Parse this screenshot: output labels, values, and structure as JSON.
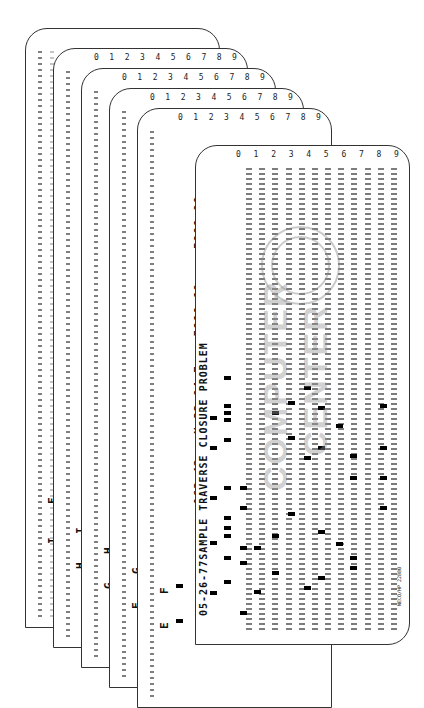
{
  "image": {
    "subject": "stack of punched computer cards",
    "card_count": 7
  },
  "cards": [
    {
      "id": 1,
      "label_left": "I",
      "label_right": "E",
      "distance": "425.44",
      "bearing": "N 16 04 W"
    },
    {
      "id": 2,
      "label_left": "H",
      "label_right": "I",
      "distance": "327.51",
      "bearing": "S 51 59 W"
    },
    {
      "id": 3,
      "label_left": "G",
      "label_right": "H",
      "distance": "319.19",
      "bearing": "S 10 30 E"
    },
    {
      "id": 4,
      "label_left": "F",
      "label_right": "G",
      "distance": "233.71",
      "bearing": "S 82 15 E"
    },
    {
      "id": 5,
      "label_left": "E",
      "label_right": "F",
      "distance": "162.42",
      "bearing": "N 32 04 E",
      "coord_1": ",5000.00",
      "coord_2": "5000.00"
    },
    {
      "id": 6,
      "header": "05-26-77SAMPLE TRAVERSE CLOSURE PROBLEM"
    },
    {
      "id": 7,
      "front": true
    }
  ],
  "card_digit_row": [
    "0",
    "1",
    "2",
    "3",
    "4",
    "5",
    "6",
    "7",
    "8",
    "9"
  ],
  "front_card": {
    "header": "05-26-77SAMPLE TRAVERSE CLOSURE PROBLEM",
    "watermark": [
      "COMPUTER",
      "CENTER"
    ],
    "imprint": "NECO/HP 22880"
  }
}
